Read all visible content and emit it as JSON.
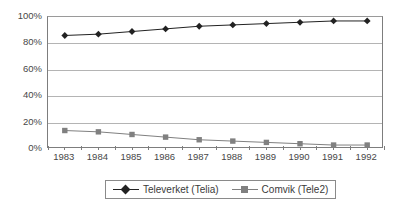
{
  "chart_data": {
    "type": "line",
    "title": "",
    "xlabel": "",
    "ylabel": "",
    "categories": [
      "1983",
      "1984",
      "1985",
      "1986",
      "1987",
      "1988",
      "1989",
      "1990",
      "1991",
      "1992"
    ],
    "series": [
      {
        "name": "Televerket (Telia)",
        "color": "#222222",
        "marker": "diamond",
        "values": [
          86,
          87,
          89,
          91,
          93,
          94,
          95,
          96,
          97,
          97
        ]
      },
      {
        "name": "Comvik (Tele2)",
        "color": "#808080",
        "marker": "square",
        "values": [
          14,
          13,
          11,
          9,
          7,
          6,
          5,
          4,
          3,
          3
        ]
      }
    ],
    "ylim": [
      0,
      100
    ],
    "yticks": [
      0,
      20,
      40,
      60,
      80,
      100
    ],
    "ytick_labels": [
      "0%",
      "20%",
      "40%",
      "60%",
      "80%",
      "100%"
    ],
    "grid": true,
    "legend_position": "bottom"
  },
  "axes": {
    "y_axis_label_suffix": "%",
    "gridline_color": "#b4b4b4",
    "frame_color": "#7d7d7d"
  },
  "legend": {
    "entries": [
      {
        "label": "Televerket (Telia)",
        "color": "#222222",
        "marker": "diamond"
      },
      {
        "label": "Comvik (Tele2)",
        "color": "#808080",
        "marker": "square"
      }
    ]
  }
}
